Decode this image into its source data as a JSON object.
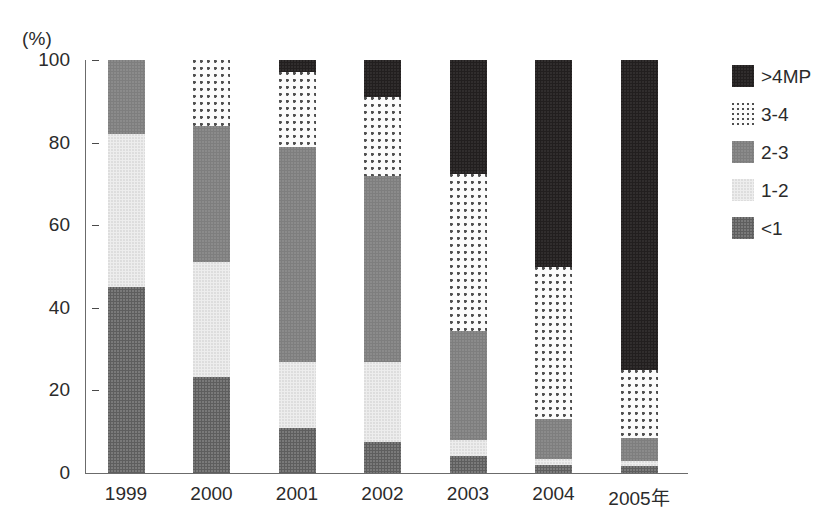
{
  "chart_data": {
    "type": "bar",
    "stacked": true,
    "title": "",
    "subtitle": "",
    "xlabel": "",
    "ylabel": "(%)",
    "unit_label": "(%)",
    "grid": false,
    "legend_position": "right",
    "ylim": [
      0,
      100
    ],
    "y_ticks": [
      0,
      20,
      40,
      60,
      80,
      100
    ],
    "y_tick_labels": [
      "0",
      "20",
      "40",
      "60",
      "80",
      "100"
    ],
    "categories": [
      "1999",
      "2000",
      "2001",
      "2002",
      "2003",
      "2004",
      "2005年"
    ],
    "series": [
      {
        "name": "<1",
        "values": [
          45.0,
          23.2,
          10.8,
          7.5,
          4.0,
          2.0,
          1.7
        ]
      },
      {
        "name": "1-2",
        "values": [
          37.0,
          27.8,
          16.2,
          19.5,
          4.0,
          1.5,
          1.3
        ]
      },
      {
        "name": "2-3",
        "values": [
          18.0,
          33.0,
          52.0,
          45.0,
          26.5,
          9.5,
          5.5
        ]
      },
      {
        "name": "3-4",
        "values": [
          0.0,
          16.0,
          18.0,
          19.0,
          38.0,
          37.0,
          16.5
        ]
      },
      {
        "name": ">4MP",
        "values": [
          0.0,
          0.0,
          3.0,
          9.0,
          27.5,
          50.0,
          75.0
        ]
      }
    ]
  },
  "legend": {
    "entries": [
      {
        "label": ">4MP",
        "swatch": "fill-gt4",
        "color": "#221f1f"
      },
      {
        "label": "3-4",
        "swatch": "fill-34",
        "color": "#fbfbfb"
      },
      {
        "label": "2-3",
        "swatch": "fill-23",
        "color": "#7e7e7e"
      },
      {
        "label": "1-2",
        "swatch": "fill-12",
        "color": "#ededed"
      },
      {
        "label": "<1",
        "swatch": "fill-lt1",
        "color": "#5e5e5e"
      }
    ]
  }
}
